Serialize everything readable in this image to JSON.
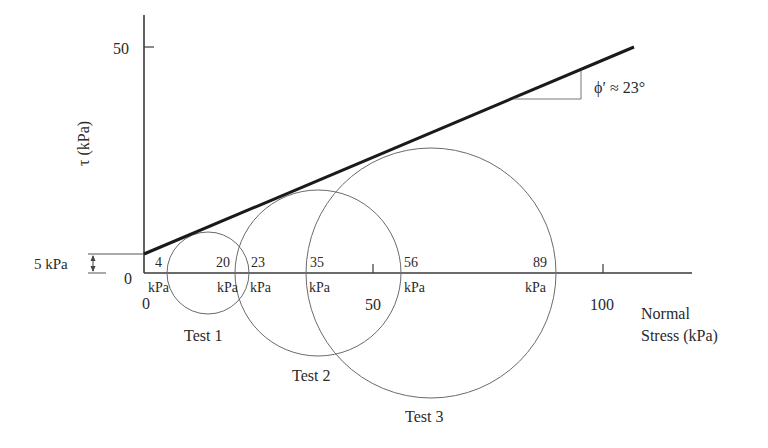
{
  "diagram": {
    "y_axis": {
      "label": "τ (kPa)",
      "ticks": [
        {
          "value": "0",
          "label": "0"
        },
        {
          "value": "50",
          "label": "50"
        }
      ]
    },
    "x_axis": {
      "label_line1": "Normal",
      "label_line2": "Stress (kPa)",
      "ticks": [
        {
          "value": "0",
          "label": "0"
        },
        {
          "value": "50",
          "label": "50"
        },
        {
          "value": "100",
          "label": "100"
        }
      ]
    },
    "cohesion": {
      "label": "5 kPa",
      "value": 5
    },
    "friction_angle": {
      "label": "ϕ′ ≈ 23°",
      "value": 23
    },
    "stress_labels": [
      {
        "value": "4",
        "unit": "kPa"
      },
      {
        "value": "20",
        "unit": "kPa"
      },
      {
        "value": "23",
        "unit": "kPa"
      },
      {
        "value": "35",
        "unit": "kPa"
      },
      {
        "value": "56",
        "unit": "kPa"
      },
      {
        "value": "89",
        "unit": "kPa"
      }
    ],
    "tests": [
      {
        "name": "Test 1",
        "sigma3": 4,
        "sigma1": 20
      },
      {
        "name": "Test 2",
        "sigma3": 23,
        "sigma1": 56
      },
      {
        "name": "Test 3",
        "sigma3": 35,
        "sigma1": 89
      }
    ],
    "colors": {
      "envelope": "#1a1a1a",
      "circles": "#6b6b6b",
      "axes": "#3a3a3a"
    }
  }
}
